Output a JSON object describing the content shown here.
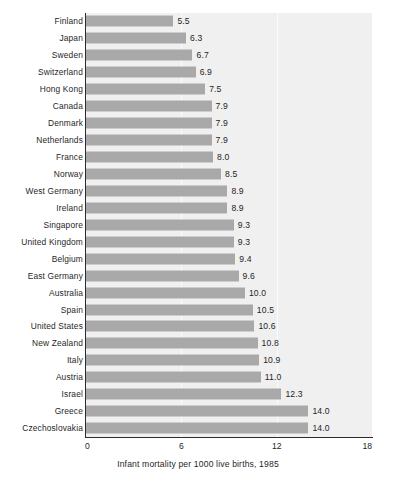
{
  "chart_data": {
    "type": "bar",
    "orientation": "horizontal",
    "title": "",
    "xlabel": "Infant mortality per 1000 live births, 1985",
    "ylabel": "",
    "xlim": [
      0,
      18
    ],
    "xticks": [
      "0",
      "6",
      "12",
      "18"
    ],
    "xtick_values": [
      0,
      6,
      12,
      18
    ],
    "gridlines": [
      6,
      12
    ],
    "grid": true,
    "legend": "none",
    "categories": [
      "Finland",
      "Japan",
      "Sweden",
      "Switzerland",
      "Hong Kong",
      "Canada",
      "Denmark",
      "Netherlands",
      "France",
      "Norway",
      "West Germany",
      "Ireland",
      "Singapore",
      "United Kingdom",
      "Belgium",
      "East Germany",
      "Australia",
      "Spain",
      "United States",
      "New Zealand",
      "Italy",
      "Austria",
      "Israel",
      "Greece",
      "Czechoslovakia"
    ],
    "values": [
      5.5,
      6.3,
      6.7,
      6.9,
      7.5,
      7.9,
      7.9,
      7.9,
      8.0,
      8.5,
      8.9,
      8.9,
      9.3,
      9.3,
      9.4,
      9.6,
      10.0,
      10.5,
      10.6,
      10.8,
      10.9,
      11.0,
      12.3,
      14.0,
      14.0
    ],
    "value_labels": [
      "5.5",
      "6.3",
      "6.7",
      "6.9",
      "7.5",
      "7.9",
      "7.9",
      "7.9",
      "8.0",
      "8.5",
      "8.9",
      "8.9",
      "9.3",
      "9.3",
      "9.4",
      "9.6",
      "10.0",
      "10.5",
      "10.6",
      "10.8",
      "10.9",
      "11.0",
      "12.3",
      "14.0",
      "14.0"
    ],
    "colors": {
      "bar": "#a9a9a9",
      "plot_background": "#f0f0f0",
      "page_background": "#ffffff",
      "axis": "#2b2b2b",
      "gridline": "#fbfbfb",
      "text": "#1f1f1f"
    }
  },
  "caption": "Infant mortality per 1000 live births, 1985"
}
